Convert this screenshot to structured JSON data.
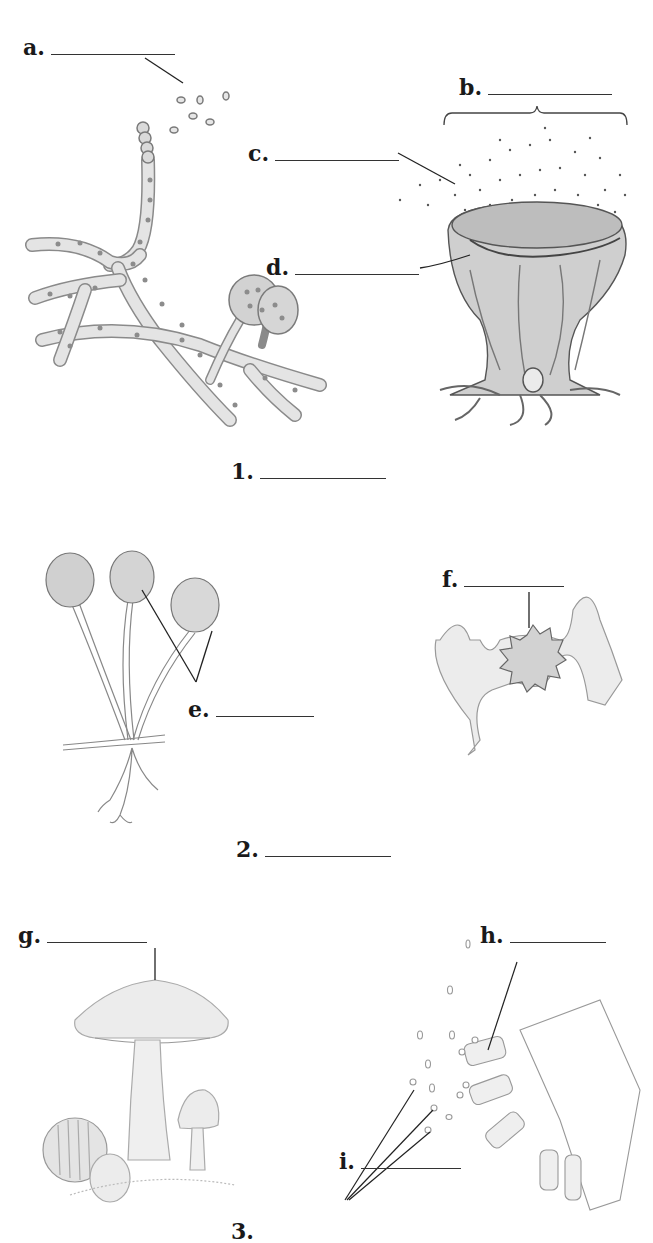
{
  "worksheet": {
    "topic": "Fungi structures labeling diagram",
    "labels": {
      "a": "a.",
      "b": "b.",
      "c": "c.",
      "d": "d.",
      "e": "e.",
      "f": "f.",
      "g": "g.",
      "h": "h.",
      "i": "i."
    },
    "groups": {
      "one": "1.",
      "two": "2.",
      "three": "3."
    },
    "answers": {
      "a": "",
      "b": "",
      "c": "",
      "d": "",
      "e": "",
      "f": "",
      "g": "",
      "h": "",
      "i": "",
      "one": "",
      "two": "",
      "three": ""
    },
    "figures": [
      {
        "id": "1-left",
        "name": "branching hyphae with spore chain and sac-like structures"
      },
      {
        "id": "1-right",
        "name": "cup-shaped fruiting body releasing spores"
      },
      {
        "id": "2-left",
        "name": "sporangia on stalks with rhizoids"
      },
      {
        "id": "2-right",
        "name": "spiny zygospore between hyphae"
      },
      {
        "id": "3-left",
        "name": "gilled mushrooms with gill detail inset"
      },
      {
        "id": "3-right",
        "name": "basidia releasing spores"
      }
    ],
    "colors": {
      "ink": "#1a1a1a",
      "fill": "#dcdcdc",
      "nucleus": "#8a8a8a",
      "background": "#ffffff"
    }
  }
}
